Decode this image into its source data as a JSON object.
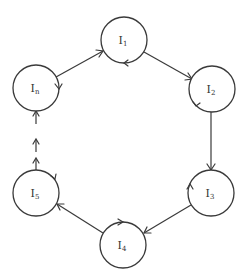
{
  "diagram": {
    "type": "cycle",
    "nodes": [
      {
        "id": "I1",
        "base": "I",
        "sub": "1",
        "cx": 124,
        "cy": 40
      },
      {
        "id": "I2",
        "base": "I",
        "sub": "2",
        "cx": 212,
        "cy": 89
      },
      {
        "id": "I3",
        "base": "I",
        "sub": "3",
        "cx": 211,
        "cy": 193
      },
      {
        "id": "I4",
        "base": "I",
        "sub": "4",
        "cx": 123,
        "cy": 245
      },
      {
        "id": "I5",
        "base": "I",
        "sub": "5",
        "cx": 36,
        "cy": 193
      },
      {
        "id": "In",
        "base": "I",
        "sub": "n",
        "cx": 36,
        "cy": 88
      }
    ],
    "edges": [
      {
        "from": "In",
        "to": "I1",
        "style": "solid"
      },
      {
        "from": "I1",
        "to": "I2",
        "style": "solid"
      },
      {
        "from": "I2",
        "to": "I3",
        "style": "solid"
      },
      {
        "from": "I3",
        "to": "I4",
        "style": "solid"
      },
      {
        "from": "I4",
        "to": "I5",
        "style": "solid"
      },
      {
        "from": "I5",
        "to": "In",
        "style": "dashed-arrows"
      }
    ],
    "node_radius": 23,
    "stroke_color": "#3a3a3a",
    "background_color": "#ffffff"
  }
}
